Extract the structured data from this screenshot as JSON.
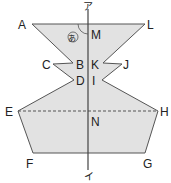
{
  "diagram": {
    "type": "geometry-figure",
    "fill_color": "#e2e2e2",
    "stroke_color": "#555555",
    "axis": {
      "top_label": "ア",
      "bottom_label": "イ"
    },
    "angle_mark_label": "あ",
    "points": {
      "A": "A",
      "B": "B",
      "C": "C",
      "D": "D",
      "E": "E",
      "F": "F",
      "G": "G",
      "H": "H",
      "I": "I",
      "J": "J",
      "K": "K",
      "L": "L",
      "M": "M",
      "N": "N"
    }
  }
}
